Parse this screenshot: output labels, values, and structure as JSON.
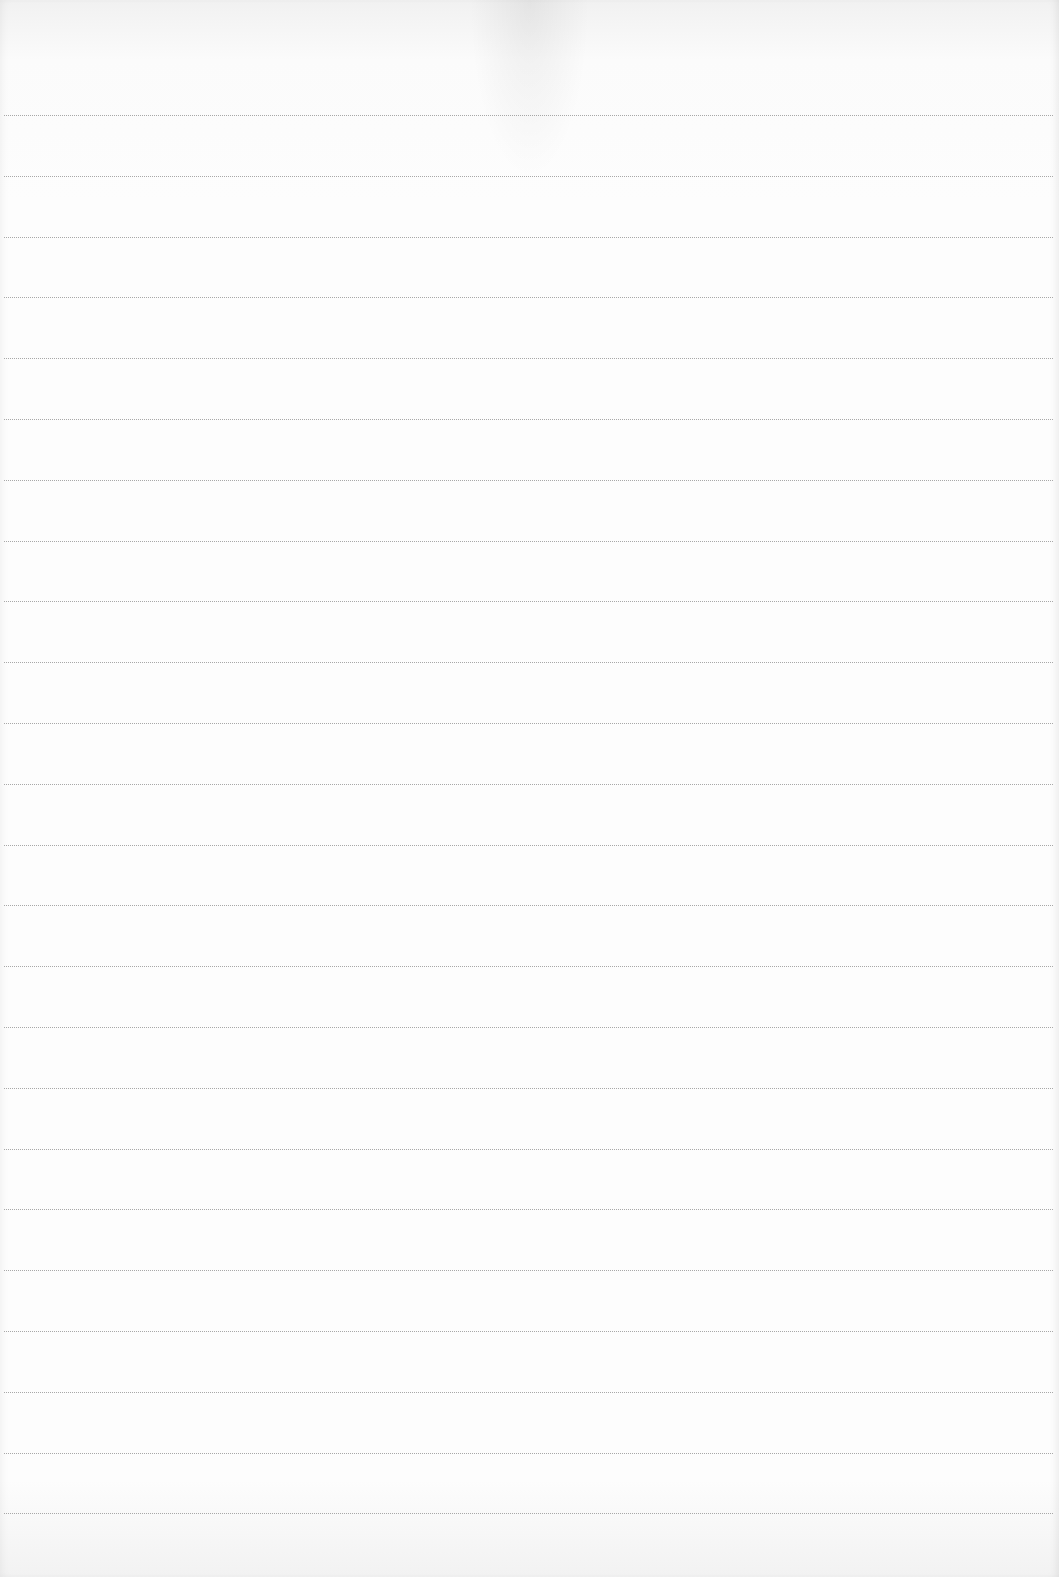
{
  "document": {
    "type": "lined-paper",
    "background_color": "#fdfdfd",
    "rule_color": "#9a9a9a",
    "rules": {
      "count": 24,
      "first_y": 115,
      "spacing": 60.8
    },
    "text_content": []
  }
}
